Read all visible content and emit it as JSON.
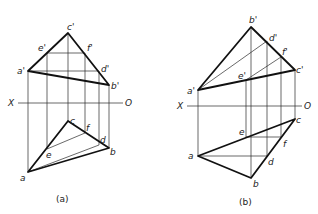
{
  "figures": [
    {
      "id": "a",
      "caption": "(a)",
      "axis": {
        "x_label": "X",
        "o_label": "O"
      },
      "front_view_labels": {
        "a": "a'",
        "b": "b'",
        "c": "c'",
        "d": "d'",
        "e": "e'",
        "f": "f'"
      },
      "top_view_labels": {
        "a": "a",
        "b": "b",
        "c": "c",
        "d": "d",
        "e": "e",
        "f": "f"
      }
    },
    {
      "id": "b",
      "caption": "(b)",
      "axis": {
        "x_label": "X",
        "o_label": "O"
      },
      "front_view_labels": {
        "a": "a'",
        "b": "b'",
        "c": "c'",
        "d": "d'",
        "e": "e'",
        "f": "f'"
      },
      "top_view_labels": {
        "a": "a",
        "b": "b",
        "c": "c",
        "d": "d",
        "e": "e",
        "f": "f"
      }
    }
  ],
  "colors": {
    "line": "#111111",
    "background": "#ffffff"
  }
}
